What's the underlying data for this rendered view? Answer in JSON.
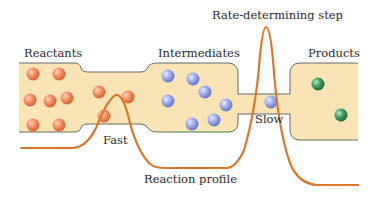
{
  "labels": {
    "reactants": "Reactants",
    "intermediates": "Intermediates",
    "products": "Products",
    "rate_determining_step": "Rate-determining step",
    "fast": "Fast",
    "slow": "Slow",
    "reaction_profile": "Reaction profile"
  },
  "colors": {
    "container_fill": "#f8e4b4",
    "container_outline": "#6a6a6a",
    "reaction_profile_curve": "#d9782f",
    "reactant_particle": "#f08a5f",
    "intermediate_particle": "#8f9de0",
    "product_particle": "#3f9a5f"
  },
  "particles": {
    "reactants": [
      {
        "x": 33,
        "y": 74
      },
      {
        "x": 59,
        "y": 74
      },
      {
        "x": 30,
        "y": 100
      },
      {
        "x": 50,
        "y": 101
      },
      {
        "x": 67,
        "y": 98
      },
      {
        "x": 33,
        "y": 125
      },
      {
        "x": 59,
        "y": 125
      },
      {
        "x": 99,
        "y": 92
      },
      {
        "x": 128,
        "y": 97
      },
      {
        "x": 104,
        "y": 116
      }
    ],
    "intermediates": [
      {
        "x": 168,
        "y": 76
      },
      {
        "x": 193,
        "y": 79
      },
      {
        "x": 205,
        "y": 92
      },
      {
        "x": 168,
        "y": 101
      },
      {
        "x": 226,
        "y": 105
      },
      {
        "x": 192,
        "y": 124
      },
      {
        "x": 214,
        "y": 120
      },
      {
        "x": 271,
        "y": 102
      }
    ],
    "products": [
      {
        "x": 318,
        "y": 84
      },
      {
        "x": 341,
        "y": 115
      }
    ]
  }
}
